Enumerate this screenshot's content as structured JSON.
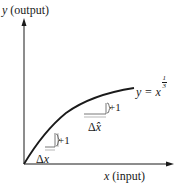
{
  "diagram": {
    "y_axis_label": {
      "variable": "y",
      "text": " (output)"
    },
    "x_axis_label": {
      "variable": "x",
      "text": " (input)"
    },
    "curve_label": {
      "lhs": "y = x",
      "exponent_numerator": "1",
      "exponent_denominator": "3"
    },
    "upper_triangle": {
      "rise_label": "+1",
      "run_label_delta": "Δ",
      "run_label_var": "x̂"
    },
    "lower_triangle": {
      "rise_label": "+1",
      "run_label_delta": "Δ",
      "run_label_var": "x"
    },
    "colors": {
      "ink": "#1a1a1a",
      "background": "#ffffff"
    }
  }
}
